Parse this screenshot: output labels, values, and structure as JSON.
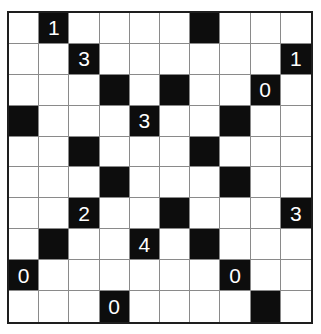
{
  "puzzle": {
    "type": "Light Up (Akari)",
    "rows": 10,
    "cols": 10,
    "colors": {
      "white_cell": "#ffffff",
      "black_cell": "#0d0d0d",
      "number": "#ffffff",
      "grid_line": "#8a8a8a",
      "border": "#1e1e1e"
    },
    "black_cells": [
      {
        "row": 0,
        "col": 1,
        "clue": "1"
      },
      {
        "row": 0,
        "col": 6,
        "clue": ""
      },
      {
        "row": 1,
        "col": 2,
        "clue": "3"
      },
      {
        "row": 1,
        "col": 9,
        "clue": "1"
      },
      {
        "row": 2,
        "col": 3,
        "clue": ""
      },
      {
        "row": 2,
        "col": 5,
        "clue": ""
      },
      {
        "row": 2,
        "col": 8,
        "clue": "0"
      },
      {
        "row": 3,
        "col": 0,
        "clue": ""
      },
      {
        "row": 3,
        "col": 4,
        "clue": "3"
      },
      {
        "row": 3,
        "col": 7,
        "clue": ""
      },
      {
        "row": 4,
        "col": 2,
        "clue": ""
      },
      {
        "row": 4,
        "col": 6,
        "clue": ""
      },
      {
        "row": 5,
        "col": 3,
        "clue": ""
      },
      {
        "row": 5,
        "col": 7,
        "clue": ""
      },
      {
        "row": 6,
        "col": 2,
        "clue": "2"
      },
      {
        "row": 6,
        "col": 5,
        "clue": ""
      },
      {
        "row": 6,
        "col": 9,
        "clue": "3"
      },
      {
        "row": 7,
        "col": 1,
        "clue": ""
      },
      {
        "row": 7,
        "col": 4,
        "clue": "4"
      },
      {
        "row": 7,
        "col": 6,
        "clue": ""
      },
      {
        "row": 8,
        "col": 0,
        "clue": "0"
      },
      {
        "row": 8,
        "col": 7,
        "clue": "0"
      },
      {
        "row": 9,
        "col": 3,
        "clue": "0"
      },
      {
        "row": 9,
        "col": 8,
        "clue": ""
      }
    ]
  }
}
